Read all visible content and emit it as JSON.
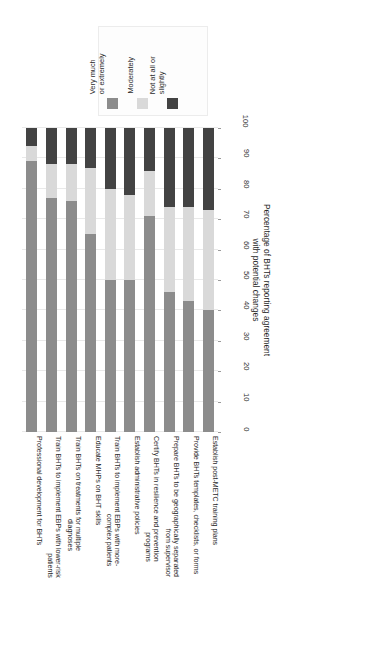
{
  "chart_data": {
    "type": "bar",
    "orientation": "stacked-horizontal-rotated",
    "title": "",
    "xlabel": "",
    "ylabel": "Percentage of BHTs reporting agreement with potential changes",
    "ylabel_lines": [
      "Percentage of BHTs reporting agreement",
      "with potential changes"
    ],
    "ylim": [
      0,
      100
    ],
    "ticks": [
      0,
      10,
      20,
      30,
      40,
      50,
      60,
      70,
      80,
      90,
      100
    ],
    "grid": true,
    "legend_position": "top",
    "categories": [
      "Professional development for BHTs",
      "Train BHTs to implement EBPs with lower-risk patients",
      "Train BHTs on treatments for multiple diagnoses",
      "Educate MHPs on BHT skills",
      "Train BHTs to implement EBPs with more-complex patients",
      "Establish administrative policies",
      "Certify BHTs in resilience and prevention programs",
      "Prepare BHTs to be geographically separated from supervisor",
      "Provide BHTs templates, checklists, or forms",
      "Establish post-METC training plans"
    ],
    "category_lines": [
      [
        "Professional development for BHTs"
      ],
      [
        "Train BHTs to implement EBPs with lower-risk",
        "patients"
      ],
      [
        "Train BHTs on treatments for multiple",
        "diagnoses"
      ],
      [
        "Educate MHPs on BHT skills"
      ],
      [
        "Train BHTs to implement EBPs with more-",
        "complex patients"
      ],
      [
        "Establish administrative policies"
      ],
      [
        "Certify BHTs in resilience and prevention",
        "programs"
      ],
      [
        "Prepare BHTs to be geographically separated",
        "from supervisor"
      ],
      [
        "Provide BHTs templates, checklists, or forms"
      ],
      [
        "Establish post-METC training plans"
      ]
    ],
    "series": [
      {
        "name": "Very much or extremely",
        "color": "#8c8c8c",
        "values": [
          89,
          77,
          76,
          65,
          50,
          50,
          71,
          46,
          43,
          40
        ]
      },
      {
        "name": "Moderately",
        "color": "#d9d9d9",
        "values": [
          5,
          11,
          12,
          22,
          30,
          28,
          15,
          28,
          31,
          33
        ]
      },
      {
        "name": "Not at all or slightly",
        "color": "#434343",
        "values": [
          6,
          12,
          12,
          13,
          20,
          22,
          14,
          26,
          26,
          27
        ]
      }
    ]
  },
  "legend": {
    "items": [
      {
        "label_lines": [
          "Very much",
          "or extremely"
        ],
        "color": "#8c8c8c",
        "swatch_name": "legend-swatch-very-much"
      },
      {
        "label_lines": [
          "Moderately"
        ],
        "color": "#d9d9d9",
        "swatch_name": "legend-swatch-moderately"
      },
      {
        "label_lines": [
          "Not at all or",
          "slightly"
        ],
        "color": "#434343",
        "swatch_name": "legend-swatch-not-at-all"
      }
    ]
  },
  "colors": {
    "grid": "#e9e9e9",
    "text": "#2b2b2b",
    "background": "#ffffff"
  }
}
